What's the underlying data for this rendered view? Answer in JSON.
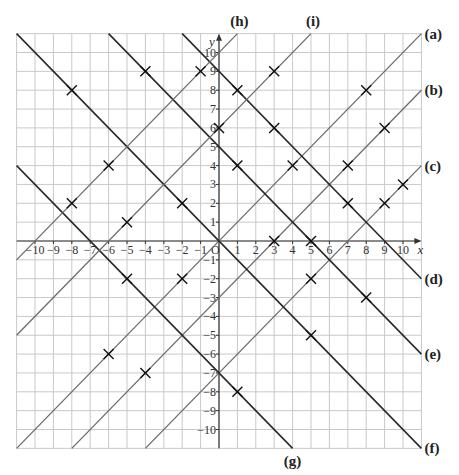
{
  "chart_data": {
    "type": "line",
    "title": "",
    "xlabel": "x",
    "ylabel": "y",
    "xlim": [
      -11,
      11
    ],
    "ylim": [
      -11,
      11
    ],
    "grid": true,
    "x_ticks": [
      -10,
      -9,
      -8,
      -7,
      -6,
      -5,
      -4,
      -3,
      -2,
      -1,
      1,
      2,
      3,
      4,
      5,
      6,
      7,
      8,
      9,
      10
    ],
    "y_ticks": [
      -10,
      -9,
      -8,
      -7,
      -6,
      -5,
      -4,
      -3,
      -2,
      -1,
      1,
      2,
      3,
      4,
      5,
      6,
      7,
      8,
      9,
      10
    ],
    "origin_label": "O",
    "series": [
      {
        "name": "(a)",
        "equation": "y = x",
        "slope": 1,
        "intercept": 0,
        "color": "#6b6b6b",
        "label_pos": "right"
      },
      {
        "name": "(b)",
        "equation": "y = x - 3",
        "slope": 1,
        "intercept": -3,
        "color": "#6b6b6b",
        "label_pos": "right"
      },
      {
        "name": "(c)",
        "equation": "y = x - 7",
        "slope": 1,
        "intercept": -7,
        "color": "#6b6b6b",
        "label_pos": "right"
      },
      {
        "name": "(d)",
        "equation": "y = -x + 9",
        "slope": -1,
        "intercept": 9,
        "color": "#2a2a2a",
        "label_pos": "right"
      },
      {
        "name": "(e)",
        "equation": "y = -x + 5",
        "slope": -1,
        "intercept": 5,
        "color": "#2a2a2a",
        "label_pos": "right"
      },
      {
        "name": "(f)",
        "equation": "y = -x",
        "slope": -1,
        "intercept": 0,
        "color": "#2a2a2a",
        "label_pos": "right"
      },
      {
        "name": "(g)",
        "equation": "y = -x - 7",
        "slope": -1,
        "intercept": -7,
        "color": "#2a2a2a",
        "label_pos": "bottom"
      },
      {
        "name": "(h)",
        "equation": "y = x + 10",
        "slope": 1,
        "intercept": 10,
        "color": "#6b6b6b",
        "label_pos": "top"
      },
      {
        "name": "(i)",
        "equation": "y = x + 6",
        "slope": 1,
        "intercept": 6,
        "color": "#6b6b6b",
        "label_pos": "top"
      }
    ],
    "marked_points": [
      [
        -8,
        8
      ],
      [
        -4,
        9
      ],
      [
        -1,
        9
      ],
      [
        0,
        6
      ],
      [
        1,
        8
      ],
      [
        3,
        9
      ],
      [
        -6,
        4
      ],
      [
        -8,
        2
      ],
      [
        -5,
        1
      ],
      [
        -2,
        2
      ],
      [
        1,
        4
      ],
      [
        3,
        6
      ],
      [
        4,
        4
      ],
      [
        7,
        4
      ],
      [
        8,
        8
      ],
      [
        9,
        6
      ],
      [
        10,
        3
      ],
      [
        7,
        2
      ],
      [
        9,
        2
      ],
      [
        3,
        0
      ],
      [
        5,
        0
      ],
      [
        -5,
        -2
      ],
      [
        -2,
        -2
      ],
      [
        5,
        -2
      ],
      [
        8,
        -3
      ],
      [
        5,
        -5
      ],
      [
        -6,
        -6
      ],
      [
        -4,
        -7
      ],
      [
        1,
        -8
      ]
    ]
  }
}
